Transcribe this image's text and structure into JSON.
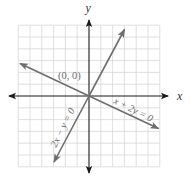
{
  "figure": {
    "type": "coordinate-plane",
    "axes": {
      "x_label": "x",
      "y_label": "y"
    },
    "grid": {
      "cells_x": 12,
      "cells_y": 12,
      "x_range": [
        -6,
        6
      ],
      "y_range": [
        -6,
        6
      ]
    },
    "point": {
      "label": "(0, 0)",
      "x": 0,
      "y": 0
    },
    "lines": [
      {
        "equation": "2x − y = 0",
        "slope": 2,
        "intercept": 0
      },
      {
        "equation": "x + 2y = 0",
        "slope": -0.5,
        "intercept": 0
      }
    ],
    "colors": {
      "grid": "#d8d8d8",
      "axes": "#1a1a1a",
      "lines": "#6e6e6e",
      "labels": "#6a6a6a"
    }
  }
}
